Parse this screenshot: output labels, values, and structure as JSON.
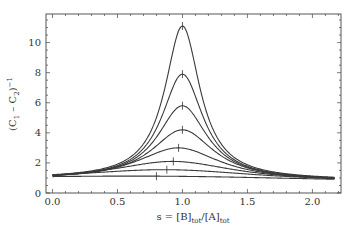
{
  "chart_data": {
    "type": "line",
    "title": "",
    "xlabel": "s = [B]tot/[A]tot",
    "xlabel_parts": {
      "main1": "s = [B]",
      "sub1": "tot",
      "main2": "/[A]",
      "sub2": "tot"
    },
    "ylabel": "(C1 − C2)^−1",
    "ylabel_parts": {
      "main1": "(C",
      "sub1": "1",
      "main2": " – C",
      "sub2": "2",
      "main3": ")",
      "sup": "−1"
    },
    "xlim": [
      -0.05,
      2.22
    ],
    "ylim": [
      0,
      11.9
    ],
    "xticks": [
      0.0,
      0.5,
      1.0,
      1.5,
      2.0
    ],
    "xtick_labels": [
      "0.0",
      "0.5",
      "1.0",
      "1.5",
      "2.0"
    ],
    "yticks": [
      0,
      2,
      4,
      6,
      8,
      10
    ],
    "ytick_labels": [
      "0",
      "2",
      "4",
      "6",
      "8",
      "10"
    ],
    "grid": false,
    "legend": null,
    "series": [
      {
        "name": "curve-1",
        "peak_x": 1.0,
        "peak_y": 11.1,
        "start_y": 0.95,
        "end_y": 0.85
      },
      {
        "name": "curve-2",
        "peak_x": 1.0,
        "peak_y": 7.9,
        "start_y": 0.93,
        "end_y": 0.83
      },
      {
        "name": "curve-3",
        "peak_x": 1.0,
        "peak_y": 5.8,
        "start_y": 0.91,
        "end_y": 0.81
      },
      {
        "name": "curve-4",
        "peak_x": 1.0,
        "peak_y": 4.2,
        "start_y": 0.89,
        "end_y": 0.79
      },
      {
        "name": "curve-5",
        "peak_x": 0.97,
        "peak_y": 3.0,
        "start_y": 0.87,
        "end_y": 0.77
      },
      {
        "name": "curve-6",
        "peak_x": 0.93,
        "peak_y": 2.1,
        "start_y": 0.85,
        "end_y": 0.75
      },
      {
        "name": "curve-7",
        "peak_x": 0.88,
        "peak_y": 1.55,
        "start_y": 0.83,
        "end_y": 0.73
      },
      {
        "name": "curve-8",
        "peak_x": 0.8,
        "peak_y": 1.12,
        "start_y": 0.81,
        "end_y": 0.71
      }
    ],
    "annotations": "Vertical tick marks indicate the maximum of each curve"
  }
}
